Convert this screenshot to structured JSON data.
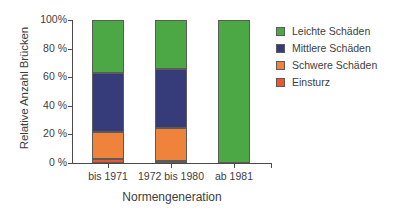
{
  "chart_data": {
    "type": "bar",
    "subtype": "stacked-100-percent",
    "title": "",
    "xlabel": "Normengeneration",
    "ylabel": "Relative Anzahl Brücken",
    "categories": [
      "bis 1971",
      "1972 bis 1980",
      "ab 1981"
    ],
    "ylim": [
      0,
      100
    ],
    "yticks": [
      0,
      20,
      40,
      60,
      80,
      100
    ],
    "ytick_labels": [
      "0 %",
      "20 %",
      "40 %",
      "60 %",
      "80 %",
      "100%"
    ],
    "grid": false,
    "legend_position": "right",
    "series": [
      {
        "name": "Leichte Schäden",
        "color": "#4CA845",
        "values": [
          37,
          34,
          100
        ]
      },
      {
        "name": "Mittlere Schäden",
        "color": "#363C79",
        "values": [
          41,
          41.5,
          0
        ]
      },
      {
        "name": "Schwere Schäden",
        "color": "#F0833C",
        "values": [
          19,
          23,
          0
        ]
      },
      {
        "name": "Einsturz",
        "color": "#F0562E",
        "values": [
          3,
          1.5,
          0
        ]
      }
    ],
    "stack_order_bottom_to_top": [
      "Einsturz",
      "Schwere Schäden",
      "Mittlere Schäden",
      "Leichte Schäden"
    ]
  },
  "legend": {
    "items": [
      {
        "label": "Leichte Schäden",
        "color": "#4CA845"
      },
      {
        "label": "Mittlere Schäden",
        "color": "#363C79"
      },
      {
        "label": "Schwere Schäden",
        "color": "#F0833C"
      },
      {
        "label": "Einsturz",
        "color": "#F0562E"
      }
    ]
  },
  "axes": {
    "y_title": "Relative Anzahl Brücken",
    "x_title": "Normengeneration"
  }
}
